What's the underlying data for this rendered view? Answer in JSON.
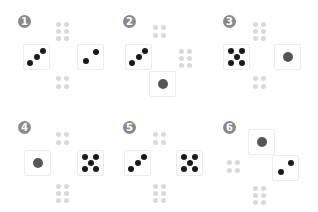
{
  "panels": [
    {
      "label": "1",
      "badge": [
        18,
        15
      ],
      "dice": [
        {
          "x": 23,
          "y": 44,
          "value": 3
        },
        {
          "x": 77,
          "y": 44,
          "value": 2
        }
      ],
      "gray": [
        {
          "x": 56,
          "y": 22,
          "value": 6
        },
        {
          "x": 56,
          "y": 76,
          "value": 4
        }
      ]
    },
    {
      "label": "2",
      "badge": [
        123,
        15
      ],
      "dice": [
        {
          "x": 125,
          "y": 44,
          "value": 3
        },
        {
          "x": 149,
          "y": 71,
          "value": 1
        }
      ],
      "gray": [
        {
          "x": 153,
          "y": 25,
          "value": 4
        },
        {
          "x": 179,
          "y": 49,
          "value": 6
        }
      ]
    },
    {
      "label": "3",
      "badge": [
        223,
        15
      ],
      "dice": [
        {
          "x": 223,
          "y": 44,
          "value": 5
        },
        {
          "x": 274,
          "y": 44,
          "value": 1
        }
      ],
      "gray": [
        {
          "x": 253,
          "y": 22,
          "value": 6
        },
        {
          "x": 253,
          "y": 76,
          "value": 4
        }
      ]
    },
    {
      "label": "4",
      "badge": [
        18,
        121
      ],
      "dice": [
        {
          "x": 24,
          "y": 150,
          "value": 1
        },
        {
          "x": 77,
          "y": 150,
          "value": 5
        }
      ],
      "gray": [
        {
          "x": 56,
          "y": 132,
          "value": 4
        },
        {
          "x": 56,
          "y": 184,
          "value": 6
        }
      ]
    },
    {
      "label": "5",
      "badge": [
        123,
        121
      ],
      "dice": [
        {
          "x": 124,
          "y": 150,
          "value": 3
        },
        {
          "x": 176,
          "y": 150,
          "value": 5
        }
      ],
      "gray": [
        {
          "x": 153,
          "y": 132,
          "value": 4
        },
        {
          "x": 153,
          "y": 184,
          "value": 6
        }
      ]
    },
    {
      "label": "6",
      "badge": [
        223,
        121
      ],
      "dice": [
        {
          "x": 248,
          "y": 129,
          "value": 1
        },
        {
          "x": 272,
          "y": 155,
          "value": 2
        }
      ],
      "gray": [
        {
          "x": 227,
          "y": 160,
          "value": 4
        },
        {
          "x": 253,
          "y": 186,
          "value": 6
        }
      ]
    }
  ],
  "colors": {
    "pip": "#1a1a1a",
    "single_pip": "#555555",
    "gray_pip": "#dadada",
    "badge": "#8a8a8a"
  }
}
